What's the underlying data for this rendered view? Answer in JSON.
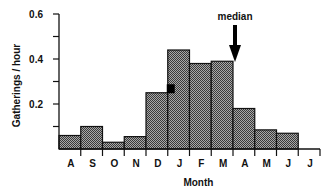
{
  "chart_data": {
    "type": "bar",
    "title": "",
    "xlabel": "Month",
    "ylabel": "Gatherings / hour",
    "categories": [
      "A",
      "S",
      "O",
      "N",
      "D",
      "J",
      "F",
      "M",
      "A",
      "M",
      "J",
      "J"
    ],
    "values": [
      0.06,
      0.1,
      0.03,
      0.055,
      0.25,
      0.44,
      0.38,
      0.39,
      0.18,
      0.085,
      0.07,
      0
    ],
    "ylim": [
      0,
      0.6
    ],
    "yticks": [
      0.2,
      0.4,
      0.6
    ],
    "ytick_labels": [
      "0.2",
      "0.4",
      "0.6"
    ],
    "yminor_ticks": [
      0.1,
      0.3,
      0.5
    ],
    "grid": false,
    "legend": null,
    "annotations": [
      {
        "type": "arrow",
        "text": "median",
        "x_category_index": 8,
        "position": "between M and A, pointing down"
      },
      {
        "type": "marker",
        "shape": "filled-square",
        "x_between": [
          "D",
          "J"
        ],
        "y": 0.27
      }
    ],
    "bar_fill": "crosshatch-gray",
    "colors": {
      "bar_fill": "#8a8a8a",
      "bar_edge": "#111111",
      "axis": "#111111",
      "marker": "#000000"
    }
  }
}
